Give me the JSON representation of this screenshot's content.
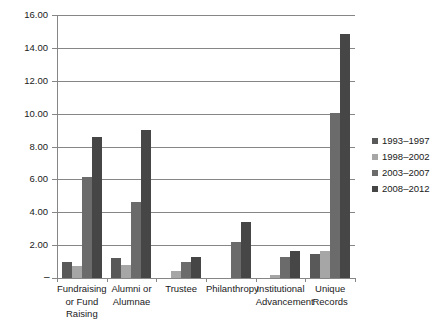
{
  "chart_data": {
    "type": "bar",
    "title": "",
    "subtitle": "",
    "xlabel": "",
    "ylabel": "",
    "ylim": [
      0,
      16
    ],
    "ytick_step": 2,
    "ytick_labels": [
      "16.00",
      "14.00",
      "12.00",
      "10.00",
      "8.00",
      "6.00",
      "4.00",
      "2.00"
    ],
    "ytick_values": [
      16,
      14,
      12,
      10,
      8,
      6,
      4,
      2
    ],
    "zero_tick_label": "–",
    "grid": true,
    "grid_axis": "y",
    "legend_position": "right",
    "orientation": "vertical",
    "grouping": "clustered",
    "categories": [
      "Fundraising or Fund Raising",
      "Alumni or Alumnae",
      "Trustee",
      "Philanthropy",
      "Institutional Advancement",
      "Unique Records"
    ],
    "category_label_lines": [
      [
        "Fundraising",
        "or Fund",
        "Raising"
      ],
      [
        "Alumni or",
        "Alumnae"
      ],
      [
        "Trustee"
      ],
      [
        "Philanthropy"
      ],
      [
        "Institutional",
        "Advancement"
      ],
      [
        "Unique",
        "Records"
      ]
    ],
    "series": [
      {
        "name": "1993–1997",
        "color": "#595959",
        "values": [
          1.0,
          1.2,
          0.0,
          0.0,
          0.0,
          1.45
        ]
      },
      {
        "name": "1998–2002",
        "color": "#a6a6a6",
        "values": [
          0.75,
          0.8,
          0.45,
          0.0,
          0.2,
          1.65
        ]
      },
      {
        "name": "2003–2007",
        "color": "#6b6b6b",
        "values": [
          6.15,
          4.6,
          1.0,
          2.2,
          1.25,
          10.05
        ]
      },
      {
        "name": "2008–2012",
        "color": "#464646",
        "values": [
          8.6,
          9.0,
          1.25,
          3.4,
          1.65,
          14.85
        ]
      }
    ]
  },
  "colors": {
    "axis": "#868686",
    "grid": "#868686",
    "text": "#1a1a1a",
    "background": "#ffffff"
  }
}
